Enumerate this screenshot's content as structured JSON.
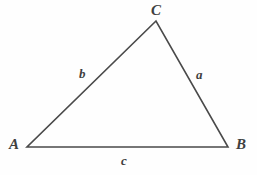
{
  "figure": {
    "kind": "geometry-diagram",
    "shape": "triangle",
    "width": 257,
    "height": 175,
    "background_color": "#fefefe",
    "stroke_color": "#4a4a4a",
    "stroke_width": 1.6,
    "label_color": "#3f3f3f"
  },
  "vertices": [
    {
      "id": "A",
      "label": "A",
      "x": 27,
      "y": 147
    },
    {
      "id": "B",
      "label": "B",
      "x": 228,
      "y": 147
    },
    {
      "id": "C",
      "label": "C",
      "x": 156,
      "y": 21
    }
  ],
  "sides": [
    {
      "id": "a",
      "label": "a",
      "from": "B",
      "to": "C"
    },
    {
      "id": "b",
      "label": "b",
      "from": "A",
      "to": "C"
    },
    {
      "id": "c",
      "label": "c",
      "from": "A",
      "to": "B"
    }
  ],
  "labels": {
    "vertex_C": "C",
    "vertex_A": "A",
    "vertex_B": "B",
    "side_b": "b",
    "side_a": "a",
    "side_c": "c"
  }
}
